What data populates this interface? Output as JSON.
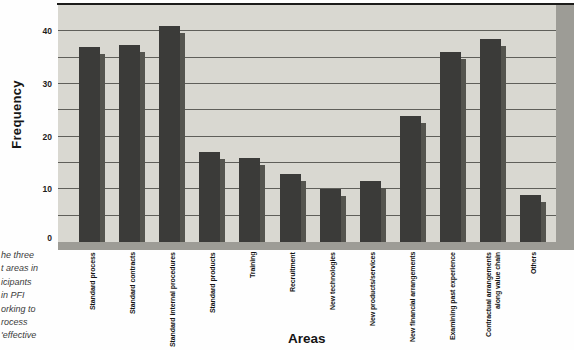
{
  "caption_fragments": [
    "he three",
    "t areas in",
    "icipants",
    "in PFI",
    "orking to",
    "rocess",
    "'effective"
  ],
  "chart_data": {
    "type": "bar",
    "title": "",
    "xlabel": "Areas",
    "ylabel": "Frequency",
    "categories": [
      "Standard process",
      "Standard contracts",
      "Standard internal procedures",
      "Standard products",
      "Training",
      "Recruitment",
      "New technologies",
      "New products/services",
      "New financial arrangements",
      "Examining past experience",
      "Contractual arrangements along value chain",
      "Others"
    ],
    "display_labels": [
      "Standard process",
      "Standard contracts",
      "Standard internal procedures",
      "Standard products",
      "Training",
      "Recruitment",
      "New technologies",
      "New products/services",
      "New financial arrangements",
      "Examining past experience",
      "Contractual arrangements\nalong value chain",
      "Others"
    ],
    "values": [
      37,
      37.5,
      41,
      17,
      16,
      13,
      10,
      11.5,
      24,
      36,
      38.5,
      9
    ],
    "ylim": [
      0,
      45
    ],
    "yticks": [
      0,
      10,
      20,
      30,
      40
    ],
    "gridline_interval": 5,
    "grid": true,
    "legend": "none",
    "bar_effect": "drop-shadow-3d",
    "colors": {
      "bar": "#3b3b39",
      "bar_shadow": "#55554f",
      "plot_bg": "#d9d8d1",
      "wall": "#9d9c96",
      "gridline": "#5f5f5a",
      "top_border": "#1c1c1a",
      "text": "#161616"
    }
  }
}
